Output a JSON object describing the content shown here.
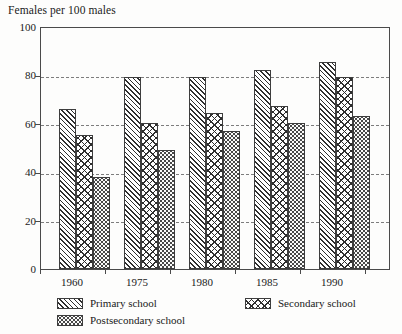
{
  "chart_data": {
    "type": "bar",
    "title": "Females per 100 males",
    "xlabel": "",
    "ylabel": "Females per 100 males",
    "ylim": [
      0,
      100
    ],
    "yticks": [
      0,
      20,
      40,
      60,
      80,
      100
    ],
    "grid": "horizontal dashed gridlines at 20, 40, 60, 80",
    "legend_position": "below plot, two columns",
    "categories": [
      "1960",
      "1975",
      "1980",
      "1985",
      "1990"
    ],
    "series": [
      {
        "name": "Primary school",
        "pattern": "diagonal-hatch",
        "values": [
          66,
          79,
          79,
          82,
          85
        ]
      },
      {
        "name": "Secondary school",
        "pattern": "cross-hatch",
        "values": [
          55,
          60,
          64,
          67,
          79
        ]
      },
      {
        "name": "Postsecondary school",
        "pattern": "stipple-dots",
        "values": [
          38,
          49,
          57,
          60,
          63
        ]
      }
    ]
  },
  "axis": {
    "y_tick_labels": [
      "100",
      "80",
      "60",
      "40",
      "20",
      "0"
    ],
    "x_tick_labels": [
      "1960",
      "1975",
      "1980",
      "1985",
      "1990"
    ]
  },
  "legend": {
    "entries": [
      {
        "label": "Primary school",
        "pattern": "diagonal-hatch"
      },
      {
        "label": "Secondary school",
        "pattern": "cross-hatch"
      },
      {
        "label": "Postsecondary school",
        "pattern": "stipple-dots"
      }
    ]
  }
}
